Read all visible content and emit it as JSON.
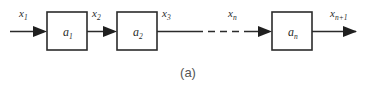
{
  "figure": {
    "caption": "(a)",
    "colors": {
      "background": "#ffffff",
      "stroke": "#2b2b2b",
      "arrow_fill": "#1f1f1f",
      "label_text": "#2b2b2b",
      "caption_text": "#555555"
    }
  },
  "blocks": [
    {
      "id": "block-1",
      "base": "a",
      "subscript": "1"
    },
    {
      "id": "block-2",
      "base": "a",
      "subscript": "2"
    },
    {
      "id": "block-n",
      "base": "a",
      "subscript": "n"
    }
  ],
  "signals": [
    {
      "id": "signal-x1",
      "base": "x",
      "subscript": "1"
    },
    {
      "id": "signal-x2",
      "base": "x",
      "subscript": "2"
    },
    {
      "id": "signal-x3",
      "base": "x",
      "subscript": "3"
    },
    {
      "id": "signal-xn",
      "base": "x",
      "subscript": "n"
    },
    {
      "id": "signal-xn1",
      "base": "x",
      "subscript": "n+1"
    }
  ],
  "ellipsis": {
    "style": "dashed",
    "meaning": "continuation"
  }
}
